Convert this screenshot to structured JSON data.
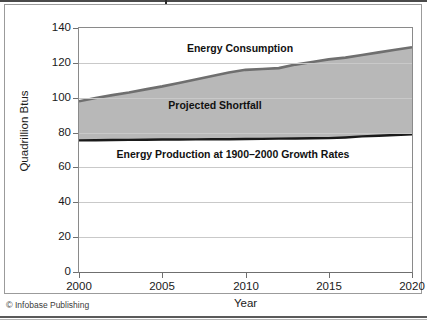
{
  "credit": {
    "mark": "©",
    "text": " Infobase Publishing"
  },
  "chart_data": {
    "type": "area",
    "title": "",
    "xlabel": "Year",
    "ylabel": "Quadrillion Btus",
    "xlim": [
      2000,
      2020
    ],
    "ylim": [
      0,
      140
    ],
    "ytick_labels": [
      "140",
      "120",
      "100",
      "80",
      "60",
      "40",
      "20",
      "0"
    ],
    "ytick_values": [
      140,
      120,
      100,
      80,
      60,
      40,
      20,
      0
    ],
    "xtick_labels": [
      "2000",
      "2005",
      "2010",
      "2015",
      "2020"
    ],
    "xtick_values": [
      2000,
      2005,
      2010,
      2015,
      2020
    ],
    "grid": true,
    "legend_position": "in-plot-annotations",
    "annotations": [
      "Energy Consumption",
      "Projected Shortfall",
      "Energy Production at 1900–2000 Growth Rates"
    ],
    "x": [
      2000,
      2001,
      2002,
      2003,
      2004,
      2005,
      2006,
      2007,
      2008,
      2009,
      2010,
      2011,
      2012,
      2013,
      2014,
      2015,
      2016,
      2017,
      2018,
      2019,
      2020
    ],
    "series": [
      {
        "name": "Energy Consumption",
        "color": "#6f6f6f",
        "fill": "#b8b8b8",
        "values": [
          98.0,
          99.8,
          101.5,
          103.0,
          104.8,
          106.5,
          108.5,
          110.5,
          112.5,
          114.5,
          116.0,
          116.5,
          117.0,
          119.0,
          120.5,
          122.0,
          123.0,
          124.5,
          126.0,
          127.5,
          129.0
        ]
      },
      {
        "name": "Energy Production at 1900–2000 Growth Rates",
        "color": "#1a1a1a",
        "fill": "#ffffff",
        "values": [
          75.5,
          75.6,
          75.7,
          75.8,
          75.9,
          76.0,
          76.0,
          76.1,
          76.2,
          76.2,
          76.3,
          76.4,
          76.5,
          76.6,
          76.7,
          76.8,
          77.2,
          77.8,
          78.2,
          78.6,
          79.0
        ]
      }
    ],
    "shaded_band": {
      "name": "Projected Shortfall",
      "color": "#b8b8b8",
      "between": [
        "Energy Production at 1900–2000 Growth Rates",
        "Energy Consumption"
      ]
    }
  }
}
